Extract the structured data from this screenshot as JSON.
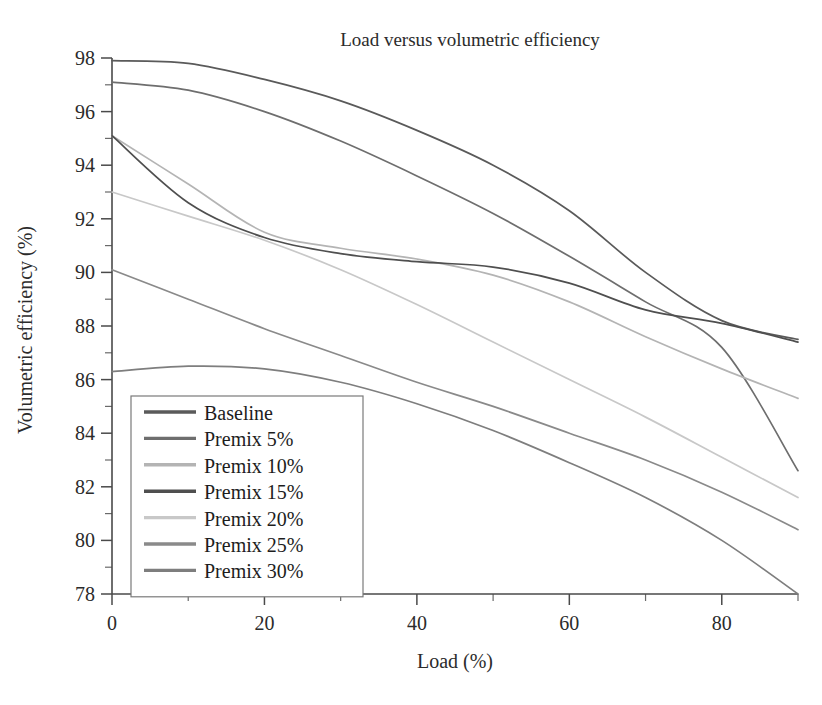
{
  "chart_data": {
    "type": "line",
    "title": "Load versus volumetric efficiency",
    "xlabel": "Load (%)",
    "ylabel": "Volumetric efficiency (%)",
    "xlim": [
      0,
      90
    ],
    "ylim": [
      78,
      98
    ],
    "grid": false,
    "legend_position": "lower-left-inside",
    "x_ticks": [
      0,
      20,
      40,
      60,
      80
    ],
    "x_tick_labels": [
      "0",
      "20",
      "40",
      "60",
      "80"
    ],
    "x_minor_ticks": [
      10,
      30,
      50,
      70,
      90
    ],
    "y_ticks": [
      78,
      80,
      82,
      84,
      86,
      88,
      90,
      92,
      94,
      96,
      98
    ],
    "y_tick_labels": [
      "78",
      "80",
      "82",
      "84",
      "86",
      "88",
      "90",
      "92",
      "94",
      "96",
      "98"
    ],
    "y_minor_ticks": [
      79,
      81,
      83,
      85,
      87,
      89,
      91,
      93,
      95,
      97
    ],
    "x": [
      0,
      10,
      20,
      30,
      40,
      50,
      60,
      70,
      80,
      90
    ],
    "series": [
      {
        "name": "Baseline",
        "color": "#5a5a5a",
        "values": [
          97.9,
          97.8,
          97.2,
          96.4,
          95.3,
          94.0,
          92.3,
          90.0,
          88.2,
          87.5
        ]
      },
      {
        "name": "Premix 5%",
        "color": "#6e6e6e",
        "values": [
          97.1,
          96.8,
          96.0,
          94.9,
          93.6,
          92.2,
          90.6,
          88.9,
          87.2,
          82.6
        ]
      },
      {
        "name": "Premix 10%",
        "color": "#b4b4b4",
        "values": [
          95.1,
          93.3,
          91.5,
          90.9,
          90.5,
          89.9,
          88.9,
          87.6,
          86.4,
          85.3
        ]
      },
      {
        "name": "Premix 15%",
        "color": "#4f4f4f",
        "values": [
          95.1,
          92.6,
          91.3,
          90.7,
          90.4,
          90.2,
          89.6,
          88.6,
          88.1,
          87.4
        ]
      },
      {
        "name": "Premix 20%",
        "color": "#c8c8c8",
        "values": [
          93.0,
          92.1,
          91.2,
          90.1,
          88.8,
          87.4,
          86.0,
          84.6,
          83.1,
          81.6
        ]
      },
      {
        "name": "Premix 25%",
        "color": "#8a8a8a",
        "values": [
          90.1,
          89.0,
          87.9,
          86.9,
          85.9,
          85.0,
          84.0,
          83.0,
          81.8,
          80.4
        ]
      },
      {
        "name": "Premix 30%",
        "color": "#7e7e7e",
        "values": [
          86.3,
          86.5,
          86.4,
          85.9,
          85.1,
          84.1,
          82.9,
          81.6,
          80.0,
          78.0
        ]
      }
    ]
  }
}
